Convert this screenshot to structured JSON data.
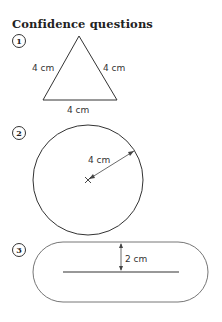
{
  "heading": "Confidence questions",
  "questions": [
    {
      "number": "1",
      "shape": "equilateral-triangle",
      "labels": {
        "left": "4 cm",
        "right": "4 cm",
        "base": "4 cm"
      }
    },
    {
      "number": "2",
      "shape": "circle",
      "labels": {
        "radius": "4 cm"
      }
    },
    {
      "number": "3",
      "shape": "stadium",
      "labels": {
        "distance": "2 cm"
      }
    }
  ]
}
